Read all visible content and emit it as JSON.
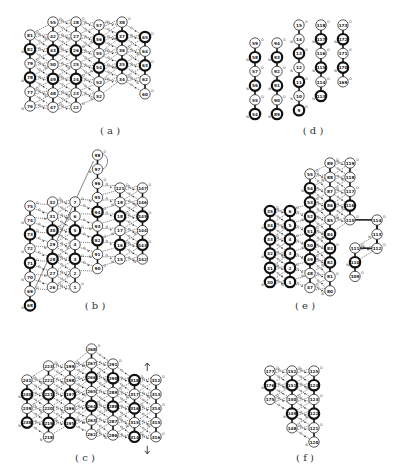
{
  "figure": {
    "panels": [
      {
        "id": "a",
        "caption": "( a )",
        "columns": [
          {
            "nodes": [
              {
                "t": "81",
                "b": 0
              },
              {
                "t": "82",
                "b": 1
              },
              {
                "t": "79",
                "b": 0
              },
              {
                "t": "78",
                "b": 1
              },
              {
                "t": "77",
                "b": 0
              },
              {
                "t": "76",
                "b": 0
              }
            ]
          },
          {
            "nodes": [
              {
                "t": "55",
                "b": 0
              },
              {
                "t": "42",
                "b": 0
              },
              {
                "t": "43",
                "b": 1
              },
              {
                "t": "50",
                "b": 0
              },
              {
                "t": "49",
                "b": 1
              },
              {
                "t": "48",
                "b": 0
              },
              {
                "t": "47",
                "b": 0
              }
            ]
          },
          {
            "nodes": [
              {
                "t": "28",
                "b": 0
              },
              {
                "t": "27",
                "b": 0
              },
              {
                "t": "26",
                "b": 1
              },
              {
                "t": "25",
                "b": 0
              },
              {
                "t": "24",
                "b": 1
              },
              {
                "t": "23",
                "b": 0
              },
              {
                "t": "22",
                "b": 0
              }
            ]
          },
          {
            "nodes": [
              {
                "t": "57",
                "b": 0
              },
              {
                "t": "56",
                "b": 1
              },
              {
                "t": "55",
                "b": 0
              },
              {
                "t": "54",
                "b": 1
              },
              {
                "t": "53",
                "b": 0
              },
              {
                "t": "52",
                "b": 0
              }
            ]
          },
          {
            "nodes": [
              {
                "t": "38",
                "b": 0
              },
              {
                "t": "37",
                "b": 1
              },
              {
                "t": "36",
                "b": 0
              },
              {
                "t": "35",
                "b": 1
              },
              {
                "t": "34",
                "b": 0
              }
            ]
          },
          {
            "nodes": [
              {
                "t": "65",
                "b": 1
              },
              {
                "t": "64",
                "b": 0
              },
              {
                "t": "63",
                "b": 1
              },
              {
                "t": "62",
                "b": 0
              },
              {
                "t": "60",
                "b": 0
              }
            ]
          }
        ]
      },
      {
        "id": "b",
        "caption": "( b )",
        "columns": [
          {
            "nodes": [
              {
                "t": "75",
                "b": 0
              },
              {
                "t": "74",
                "b": 0
              },
              {
                "t": "73",
                "b": 1
              },
              {
                "t": "72",
                "b": 0
              },
              {
                "t": "71",
                "b": 1
              },
              {
                "t": "70",
                "b": 0
              },
              {
                "t": "69",
                "b": 0
              },
              {
                "t": "68",
                "b": 1
              }
            ]
          },
          {
            "nodes": [
              {
                "t": "32",
                "b": 0
              },
              {
                "t": "31",
                "b": 0
              },
              {
                "t": "30",
                "b": 1
              },
              {
                "t": "29",
                "b": 0
              },
              {
                "t": "28",
                "b": 1
              },
              {
                "t": "27",
                "b": 0
              },
              {
                "t": "26",
                "b": 0
              }
            ]
          },
          {
            "nodes": [
              {
                "t": "7",
                "b": 0
              },
              {
                "t": "6",
                "b": 0
              },
              {
                "t": "5",
                "b": 1
              },
              {
                "t": "4",
                "b": 0
              },
              {
                "t": "3",
                "b": 1
              },
              {
                "t": "2",
                "b": 0
              },
              {
                "t": "1",
                "b": 0
              }
            ]
          },
          {
            "nodes": [
              {
                "t": "98",
                "b": 0
              },
              {
                "t": "97",
                "b": 0
              },
              {
                "t": "96",
                "b": 0
              },
              {
                "t": "95",
                "b": 0
              },
              {
                "t": "94",
                "b": 1
              },
              {
                "t": "93",
                "b": 0
              },
              {
                "t": "92",
                "b": 1
              },
              {
                "t": "91",
                "b": 0
              },
              {
                "t": "90",
                "b": 0
              }
            ]
          },
          {
            "nodes": [
              {
                "t": "121",
                "b": 0
              },
              {
                "t": "19",
                "b": 0
              },
              {
                "t": "18",
                "b": 1
              },
              {
                "t": "17",
                "b": 0
              },
              {
                "t": "16",
                "b": 1
              },
              {
                "t": "15",
                "b": 0
              }
            ]
          },
          {
            "nodes": [
              {
                "t": "147",
                "b": 0
              },
              {
                "t": "146",
                "b": 0
              },
              {
                "t": "145",
                "b": 1
              },
              {
                "t": "144",
                "b": 0
              },
              {
                "t": "143",
                "b": 1
              },
              {
                "t": "142",
                "b": 0
              }
            ]
          }
        ]
      },
      {
        "id": "c",
        "caption": "( c )",
        "columns": [
          {
            "nodes": [
              {
                "t": "241",
                "b": 0
              },
              {
                "t": "240",
                "b": 1
              },
              {
                "t": "239",
                "b": 0
              },
              {
                "t": "238",
                "b": 1
              }
            ]
          },
          {
            "nodes": [
              {
                "t": "223",
                "b": 0
              },
              {
                "t": "222",
                "b": 0
              },
              {
                "t": "221",
                "b": 1
              },
              {
                "t": "220",
                "b": 0
              },
              {
                "t": "219",
                "b": 1
              },
              {
                "t": "218",
                "b": 0
              }
            ]
          },
          {
            "nodes": [
              {
                "t": "199",
                "b": 0
              },
              {
                "t": "198",
                "b": 0
              },
              {
                "t": "197",
                "b": 1
              },
              {
                "t": "196",
                "b": 0
              },
              {
                "t": "195",
                "b": 1
              }
            ]
          },
          {
            "nodes": [
              {
                "t": "268",
                "b": 0
              },
              {
                "t": "267",
                "b": 0
              },
              {
                "t": "266",
                "b": 1
              },
              {
                "t": "265",
                "b": 0
              },
              {
                "t": "264",
                "b": 1
              },
              {
                "t": "263",
                "b": 0
              },
              {
                "t": "262",
                "b": 0
              }
            ]
          },
          {
            "nodes": [
              {
                "t": "291",
                "b": 0
              },
              {
                "t": "290",
                "b": 1
              },
              {
                "t": "289",
                "b": 0
              },
              {
                "t": "288",
                "b": 1
              },
              {
                "t": "287",
                "b": 0
              },
              {
                "t": "286",
                "b": 0
              }
            ]
          },
          {
            "nodes": [
              {
                "t": "318",
                "b": 1
              },
              {
                "t": "317",
                "b": 0
              },
              {
                "t": "316",
                "b": 1
              },
              {
                "t": "315",
                "b": 0
              },
              {
                "t": "314",
                "b": 1
              }
            ]
          },
          {
            "nodes": [
              {
                "t": "312",
                "b": 0
              },
              {
                "t": "313",
                "b": 0
              },
              {
                "t": "314",
                "b": 0
              },
              {
                "t": "315",
                "b": 0
              },
              {
                "t": "316",
                "b": 0
              }
            ]
          }
        ],
        "arrows": [
          "up",
          "down"
        ]
      },
      {
        "id": "d",
        "caption": "( d )",
        "columns": [
          {
            "nodes": [
              {
                "t": "59",
                "b": 0
              },
              {
                "t": "58",
                "b": 1
              },
              {
                "t": "57",
                "b": 0
              },
              {
                "t": "56",
                "b": 1
              },
              {
                "t": "55",
                "b": 0
              },
              {
                "t": "54",
                "b": 1
              }
            ]
          },
          {
            "nodes": [
              {
                "t": "94",
                "b": 0
              },
              {
                "t": "93",
                "b": 1
              },
              {
                "t": "92",
                "b": 0
              },
              {
                "t": "91",
                "b": 1
              },
              {
                "t": "90",
                "b": 0
              },
              {
                "t": "89",
                "b": 1
              }
            ]
          },
          {
            "nodes": [
              {
                "t": "15",
                "b": 0
              },
              {
                "t": "14",
                "b": 0
              },
              {
                "t": "13",
                "b": 1
              },
              {
                "t": "12",
                "b": 0
              },
              {
                "t": "11",
                "b": 1
              },
              {
                "t": "10",
                "b": 0
              },
              {
                "t": "9",
                "b": 1
              }
            ]
          },
          {
            "nodes": [
              {
                "t": "118",
                "b": 0
              },
              {
                "t": "117",
                "b": 1
              },
              {
                "t": "116",
                "b": 0
              },
              {
                "t": "115",
                "b": 1
              },
              {
                "t": "114",
                "b": 0
              },
              {
                "t": "113",
                "b": 1
              }
            ]
          },
          {
            "nodes": [
              {
                "t": "173",
                "b": 0
              },
              {
                "t": "172",
                "b": 1
              },
              {
                "t": "171",
                "b": 0
              },
              {
                "t": "170",
                "b": 1
              },
              {
                "t": "169",
                "b": 0
              }
            ]
          }
        ]
      },
      {
        "id": "e",
        "caption": "( e )",
        "columns": [
          {
            "nodes": [
              {
                "t": "35",
                "b": 1
              },
              {
                "t": "34",
                "b": 1
              },
              {
                "t": "33",
                "b": 1
              },
              {
                "t": "32",
                "b": 1
              },
              {
                "t": "31",
                "b": 1
              },
              {
                "t": "30",
                "b": 1
              }
            ]
          },
          {
            "nodes": [
              {
                "t": "6",
                "b": 1
              },
              {
                "t": "5",
                "b": 1
              },
              {
                "t": "4",
                "b": 1
              },
              {
                "t": "3",
                "b": 1
              },
              {
                "t": "2",
                "b": 1
              },
              {
                "t": "1",
                "b": 1
              }
            ]
          },
          {
            "nodes": [
              {
                "t": "55",
                "b": 0
              },
              {
                "t": "54",
                "b": 1
              },
              {
                "t": "53",
                "b": 1
              },
              {
                "t": "52",
                "b": 1
              },
              {
                "t": "51",
                "b": 1
              },
              {
                "t": "50",
                "b": 1
              },
              {
                "t": "49",
                "b": 1
              },
              {
                "t": "48",
                "b": 0
              },
              {
                "t": "47",
                "b": 0
              }
            ]
          },
          {
            "nodes": [
              {
                "t": "89",
                "b": 0
              },
              {
                "t": "88",
                "b": 0
              },
              {
                "t": "87",
                "b": 0
              },
              {
                "t": "86",
                "b": 1
              },
              {
                "t": "85",
                "b": 0
              },
              {
                "t": "84",
                "b": 1
              },
              {
                "t": "83",
                "b": 1
              },
              {
                "t": "82",
                "b": 1
              },
              {
                "t": "81",
                "b": 0
              },
              {
                "t": "80",
                "b": 0
              }
            ]
          },
          {
            "nodes": [
              {
                "t": "119",
                "b": 0
              },
              {
                "t": "118",
                "b": 0
              },
              {
                "t": "117",
                "b": 0
              },
              {
                "t": "116",
                "b": 1
              },
              {
                "t": "115",
                "b": 0
              }
            ]
          },
          {
            "nodes": [
              {
                "t": "111",
                "b": 0
              },
              {
                "t": "110",
                "b": 1
              },
              {
                "t": "109",
                "b": 0
              }
            ]
          },
          {
            "nodes": [
              {
                "t": "114",
                "b": 0
              },
              {
                "t": "113",
                "b": 0
              },
              {
                "t": "112",
                "b": 0
              }
            ]
          }
        ]
      },
      {
        "id": "f",
        "caption": "( f )",
        "columns": [
          {
            "nodes": [
              {
                "t": "177",
                "b": 0
              },
              {
                "t": "176",
                "b": 1
              },
              {
                "t": "175",
                "b": 0
              }
            ]
          },
          {
            "nodes": [
              {
                "t": "152",
                "b": 0
              },
              {
                "t": "151",
                "b": 1
              },
              {
                "t": "150",
                "b": 0
              },
              {
                "t": "149",
                "b": 1
              },
              {
                "t": "148",
                "b": 0
              }
            ]
          },
          {
            "nodes": [
              {
                "t": "125",
                "b": 0
              },
              {
                "t": "124",
                "b": 1
              },
              {
                "t": "123",
                "b": 0
              },
              {
                "t": "122",
                "b": 1
              },
              {
                "t": "121",
                "b": 0
              },
              {
                "t": "120",
                "b": 0
              }
            ]
          }
        ]
      }
    ],
    "bond_labels": {
      "o": "O",
      "n": "N"
    }
  }
}
